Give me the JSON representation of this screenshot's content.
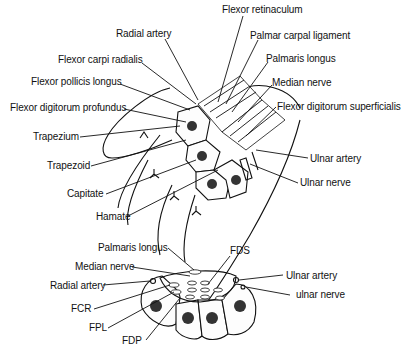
{
  "figure": {
    "top_diagram": {
      "labels": {
        "flexor_retinaculum": "Flexor retinaculum",
        "radial_artery": "Radial artery",
        "palmar_carpal_ligament": "Palmar carpal ligament",
        "flexor_carpi_radialis": "Flexor carpi radialis",
        "palmaris_longus": "Palmaris longus",
        "flexor_pollicis_longus": "Flexor pollicis longus",
        "median_nerve": "Median nerve",
        "flexor_digitorum_profundus": "Flexor digitorum profundus",
        "flexor_digitorum_superficialis": "Flexor digitorum superficialis",
        "trapezium": "Trapezium",
        "trapezoid": "Trapezoid",
        "ulnar_artery": "Ulnar artery",
        "ulnar_nerve": "Ulnar nerve",
        "capitate": "Capitate",
        "hamate": "Hamate"
      }
    },
    "bottom_diagram": {
      "labels": {
        "palmaris_longus": "Palmaris longus",
        "fds": "FDS",
        "median_nerve": "Median nerve",
        "ulnar_artery": "Ulnar artery",
        "radial_artery": "Radial artery",
        "ulnar_nerve": "ulnar nerve",
        "fcr": "FCR",
        "fpl": "FPL",
        "fdp": "FDP"
      }
    }
  }
}
